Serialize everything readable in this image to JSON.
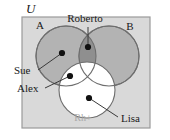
{
  "figure": {
    "type": "venn-diagram",
    "universe_label": "U",
    "background": "#ffffff",
    "frame": {
      "x": 22,
      "y": 17,
      "width": 128,
      "height": 111,
      "fill": "#d9d9d9",
      "stroke": "#9a9a9a"
    },
    "sets": [
      {
        "name": "A",
        "label": "A",
        "label_x": 40,
        "label_y": 29,
        "cx": 66,
        "cy": 56,
        "r": 30,
        "fill": "#b3b3b3",
        "stroke": "#6e6e6e"
      },
      {
        "name": "B",
        "label": "B",
        "label_x": 130,
        "label_y": 30,
        "cx": 109,
        "cy": 56,
        "r": 30,
        "fill": "#b3b3b3",
        "stroke": "#6e6e6e"
      },
      {
        "name": "Rh+",
        "label": "Rh+",
        "label_x": 83,
        "label_y": 121,
        "cx": 87,
        "cy": 90,
        "r": 28,
        "fill": "#ffffff",
        "stroke": "#6e6e6e",
        "label_color": "#a8a8a8"
      }
    ],
    "intersection_fill": "#8f8f8f",
    "points": [
      {
        "name": "Roberto",
        "label": "Roberto",
        "x": 88,
        "y": 47,
        "label_x": 85,
        "label_y": 22,
        "leader_x": 88,
        "leader_y": 27,
        "anchor": "middle",
        "region": "A and B"
      },
      {
        "name": "Sue",
        "label": "Sue",
        "x": 62,
        "y": 53,
        "label_x": 14,
        "label_y": 74,
        "leader_x": 38,
        "leader_y": 70,
        "anchor": "start",
        "region": "A only"
      },
      {
        "name": "Alex",
        "label": "Alex",
        "x": 70,
        "y": 76,
        "label_x": 17,
        "label_y": 92,
        "leader_x": 45,
        "leader_y": 88,
        "anchor": "start",
        "region": "A and Rh+"
      },
      {
        "name": "Lisa",
        "label": "Lisa",
        "x": 89,
        "y": 98,
        "label_x": 121,
        "label_y": 122,
        "leader_x": 118,
        "leader_y": 117,
        "anchor": "start",
        "region": "Rh+ only"
      }
    ],
    "point_color": "#111111",
    "point_radius": 3.1,
    "leader_color": "#3a3a3a",
    "text_color": "#1a1a1a"
  }
}
